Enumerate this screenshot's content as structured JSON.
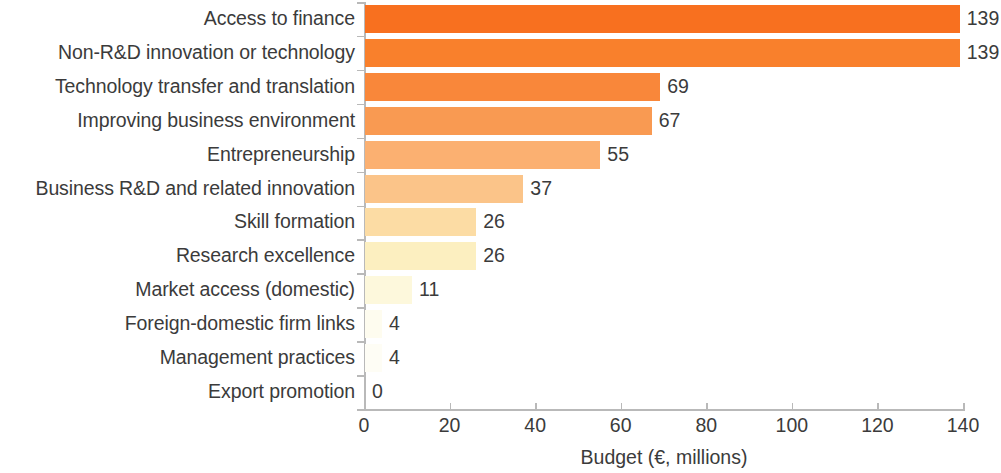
{
  "chart_data": {
    "type": "bar",
    "orientation": "horizontal",
    "title": "",
    "xlabel": "Budget (€, millions)",
    "ylabel": "",
    "xlim": [
      0,
      140
    ],
    "xticks": [
      0,
      20,
      40,
      60,
      80,
      100,
      120,
      140
    ],
    "xtick_labels": [
      "0",
      "20",
      "40",
      "60",
      "80",
      "100",
      "120",
      "140"
    ],
    "grid": false,
    "legend": null,
    "categories": [
      "Access to finance",
      "Non-R&D innovation or technology",
      "Technology transfer and translation",
      "Improving business environment",
      "Entrepreneurship",
      "Business R&D and related innovation",
      "Skill formation",
      "Research excellence",
      "Market access (domestic)",
      "Foreign-domestic firm links",
      "Management practices",
      "Export promotion"
    ],
    "values": [
      139,
      139,
      69,
      67,
      55,
      37,
      26,
      26,
      11,
      4,
      4,
      0
    ],
    "value_labels": [
      "139",
      "139",
      "69",
      "67",
      "55",
      "37",
      "26",
      "26",
      "11",
      "4",
      "4",
      "0"
    ],
    "bar_colors": [
      "#F8701F",
      "#F9802C",
      "#F9873A",
      "#F99A52",
      "#FBB071",
      "#FBC489",
      "#FCDCA4",
      "#FCEFC0",
      "#FDF8DC",
      "#FEFCEF",
      "#FEFDF5",
      "#FFFFFF"
    ],
    "axis_color": "#b9b9b9",
    "text_color": "#3b3b3b",
    "background": "#ffffff"
  }
}
